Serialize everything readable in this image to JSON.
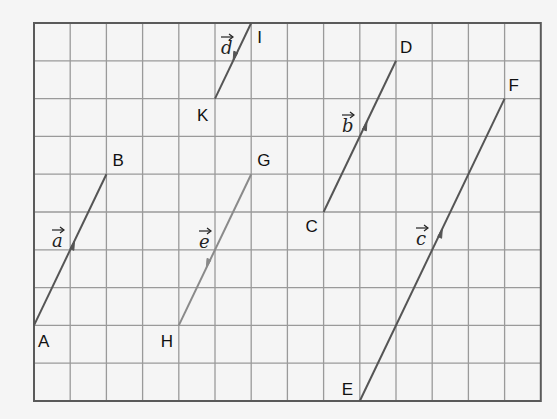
{
  "grid": {
    "origin_x": 34,
    "origin_y": 23,
    "cols": 14,
    "rows": 10,
    "cell_w": 36.2,
    "cell_h": 37.8,
    "line_color": "#9a9a9a",
    "border_color": "#5a5a5a",
    "background": "#f5f5f5"
  },
  "points": [
    {
      "name": "A",
      "col": 0,
      "row": 8,
      "label_dx": 4,
      "label_dy": 22
    },
    {
      "name": "B",
      "col": 2,
      "row": 4,
      "label_dx": 6,
      "label_dy": -8
    },
    {
      "name": "I",
      "col": 6,
      "row": 0,
      "label_dx": 6,
      "label_dy": 20
    },
    {
      "name": "K",
      "col": 5,
      "row": 2,
      "label_dx": -18,
      "label_dy": 22
    },
    {
      "name": "G",
      "col": 6,
      "row": 4,
      "label_dx": 6,
      "label_dy": -8
    },
    {
      "name": "H",
      "col": 4,
      "row": 8,
      "label_dx": -18,
      "label_dy": 22
    },
    {
      "name": "C",
      "col": 8,
      "row": 5,
      "label_dx": -18,
      "label_dy": 20
    },
    {
      "name": "D",
      "col": 10,
      "row": 1,
      "label_dx": 4,
      "label_dy": -8
    },
    {
      "name": "E",
      "col": 9,
      "row": 10,
      "label_dx": -18,
      "label_dy": -6
    },
    {
      "name": "F",
      "col": 13,
      "row": 2,
      "label_dx": 4,
      "label_dy": -8
    }
  ],
  "vectors": [
    {
      "name": "a",
      "from": "A",
      "to": "B",
      "color": "#555555",
      "arrow_t": 0.56,
      "label": "a",
      "label_x": 52,
      "label_y": 247
    },
    {
      "name": "d",
      "from": "I",
      "to": "K",
      "color": "#555555",
      "arrow_t": 0.5,
      "label": "d",
      "label_x": 221,
      "label_y": 54
    },
    {
      "name": "e",
      "from": "G",
      "to": "H",
      "color": "#8a8a8a",
      "arrow_t": 0.62,
      "label": "e",
      "label_x": 199,
      "label_y": 248
    },
    {
      "name": "b",
      "from": "C",
      "to": "D",
      "color": "#555555",
      "arrow_t": 0.6,
      "label": "b",
      "label_x": 342,
      "label_y": 132
    },
    {
      "name": "c",
      "from": "E",
      "to": "F",
      "color": "#555555",
      "arrow_t": 0.57,
      "label": "c",
      "label_x": 416,
      "label_y": 245
    }
  ]
}
